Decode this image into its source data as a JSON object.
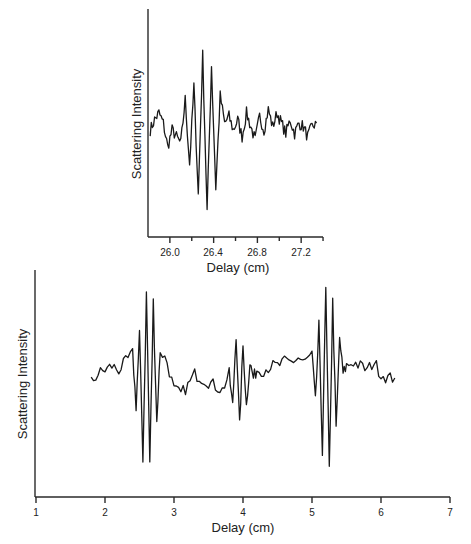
{
  "chart_data": [
    {
      "id": "inset",
      "type": "line",
      "title": "",
      "xlabel": "Delay (cm)",
      "ylabel": "Scattering Intensity",
      "xlim": [
        25.8,
        27.4
      ],
      "x_ticks": [
        26.0,
        26.4,
        26.8,
        27.2
      ],
      "x_tick_labels": [
        "26.0",
        "26.4",
        "26.8",
        "27.2"
      ],
      "x_minor_ticks": [
        26.2,
        26.6,
        27.0,
        27.4
      ],
      "y_ticks": [],
      "grid": false,
      "legend": null,
      "series": [
        {
          "name": "interferogram",
          "description": "single wave-packet burst centered near 26.35 cm on noisy baseline",
          "x": [
            25.82,
            25.86,
            25.9,
            25.94,
            25.98,
            26.02,
            26.06,
            26.1,
            26.14,
            26.18,
            26.22,
            26.26,
            26.3,
            26.34,
            26.38,
            26.42,
            26.46,
            26.5,
            26.54,
            26.58,
            26.62,
            26.66,
            26.7,
            26.74,
            26.78,
            26.82,
            26.86,
            26.9,
            26.94,
            26.98,
            27.02,
            27.06,
            27.1,
            27.14,
            27.18,
            27.22,
            27.26,
            27.3,
            27.34
          ],
          "y": [
            0.0,
            0.15,
            0.25,
            0.1,
            -0.25,
            0.0,
            -0.1,
            -0.2,
            0.45,
            -0.5,
            0.65,
            -0.95,
            1.1,
            -1.2,
            0.95,
            -0.85,
            0.5,
            0.1,
            0.2,
            0.0,
            0.15,
            -0.1,
            0.25,
            0.05,
            -0.15,
            0.2,
            0.0,
            0.3,
            0.05,
            0.25,
            0.1,
            -0.05,
            0.15,
            -0.05,
            0.1,
            0.05,
            -0.1,
            0.05,
            0.1
          ]
        }
      ]
    },
    {
      "id": "main",
      "type": "line",
      "title": "",
      "xlabel": "Delay (cm)",
      "ylabel": "Scattering Intensity",
      "xlim": [
        1,
        7
      ],
      "x_ticks": [
        1,
        2,
        3,
        4,
        5,
        6,
        7
      ],
      "x_tick_labels": [
        "1",
        "2",
        "3",
        "4",
        "5",
        "6",
        "7"
      ],
      "y_ticks": [],
      "grid": false,
      "legend": null,
      "series": [
        {
          "name": "interferogram",
          "description": "three echoes: strong burst ~2.6 cm, weak burst ~4.0 cm, strong burst ~5.25 cm",
          "x": [
            1.8,
            1.9,
            2.0,
            2.1,
            2.2,
            2.3,
            2.4,
            2.45,
            2.5,
            2.55,
            2.6,
            2.65,
            2.7,
            2.75,
            2.8,
            2.9,
            3.0,
            3.1,
            3.2,
            3.3,
            3.4,
            3.5,
            3.6,
            3.7,
            3.8,
            3.85,
            3.9,
            3.95,
            4.0,
            4.05,
            4.1,
            4.15,
            4.2,
            4.3,
            4.4,
            4.5,
            4.6,
            4.7,
            4.8,
            4.9,
            5.0,
            5.05,
            5.1,
            5.15,
            5.2,
            5.25,
            5.3,
            5.35,
            5.4,
            5.45,
            5.5,
            5.6,
            5.7,
            5.8,
            5.9,
            6.0,
            6.1,
            6.2
          ],
          "y": [
            -0.05,
            0.05,
            0.1,
            0.15,
            0.1,
            0.2,
            0.3,
            -0.35,
            0.55,
            -1.0,
            1.05,
            -1.05,
            0.95,
            -0.55,
            0.35,
            0.2,
            -0.15,
            -0.2,
            -0.1,
            0.05,
            0.0,
            -0.05,
            -0.1,
            -0.15,
            0.05,
            -0.35,
            0.55,
            -0.6,
            0.4,
            -0.35,
            0.2,
            0.0,
            0.1,
            0.1,
            0.15,
            0.15,
            0.2,
            0.2,
            0.25,
            0.2,
            0.3,
            -0.3,
            0.65,
            -0.9,
            1.1,
            -1.15,
            0.95,
            -0.65,
            0.5,
            0.05,
            0.15,
            0.2,
            0.15,
            0.1,
            0.2,
            0.05,
            0.0,
            0.0
          ]
        }
      ]
    }
  ],
  "inset": {
    "xlabel": "Delay (cm)",
    "ylabel": "Scattering Intensity",
    "tick_labels": [
      "26.0",
      "26.4",
      "26.8",
      "27.2"
    ]
  },
  "main": {
    "xlabel": "Delay (cm)",
    "ylabel": "Scattering Intensity",
    "tick_labels": [
      "1",
      "2",
      "3",
      "4",
      "5",
      "6",
      "7"
    ]
  }
}
